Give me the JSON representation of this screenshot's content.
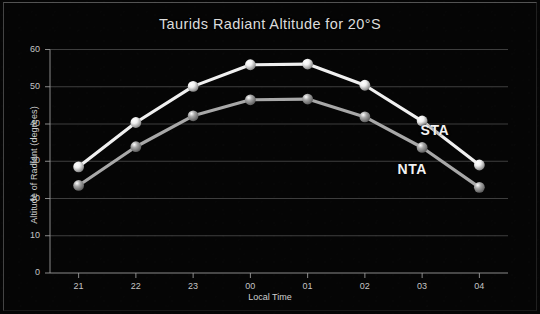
{
  "chart_data": {
    "type": "line",
    "title": "Taurids Radiant Altitude for 20°S",
    "xlabel": "Local Time",
    "ylabel": "Altitude of Radiant (degrees)",
    "categories": [
      "21",
      "22",
      "23",
      "00",
      "01",
      "02",
      "03",
      "04"
    ],
    "xlim": [
      0,
      7
    ],
    "ylim": [
      0,
      60
    ],
    "yticks": [
      "0",
      "10",
      "20",
      "30",
      "40",
      "50",
      "60"
    ],
    "grid": true,
    "legend_position": "inline-annotation",
    "series": [
      {
        "name": "STA",
        "color": "#f0f0f0",
        "marker": "circle",
        "values": [
          28.5,
          40.4,
          50.1,
          55.9,
          56.1,
          50.4,
          40.8,
          29.0
        ],
        "annotation": "STA"
      },
      {
        "name": "NTA",
        "color": "#a8a8a8",
        "marker": "circle",
        "values": [
          23.5,
          33.9,
          42.2,
          46.5,
          46.7,
          41.9,
          33.7,
          23.0
        ],
        "annotation": "NTA"
      }
    ],
    "annotations": [
      {
        "text": "STA",
        "x": 6.25,
        "y": 38.0
      },
      {
        "text": "NTA",
        "x": 5.85,
        "y": 27.6
      }
    ]
  },
  "colors": {
    "background": "#050505",
    "grid": "#5a5a5a",
    "axis": "#9a9a9a",
    "text": "#c8c8c8",
    "sta": "#f0f0f0",
    "nta": "#a8a8a8"
  }
}
